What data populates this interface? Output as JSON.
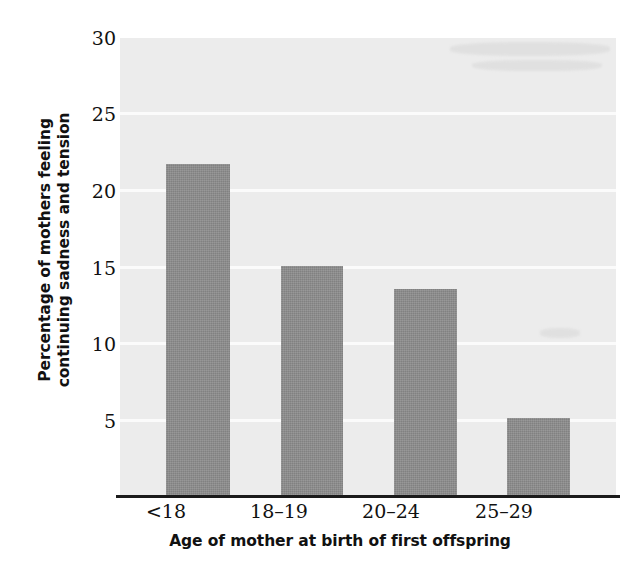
{
  "chart_data": {
    "type": "bar",
    "title": "",
    "categories": [
      "<18",
      "18–19",
      "20–24",
      "25–29"
    ],
    "values": [
      21.8,
      15.1,
      13.6,
      5.2
    ],
    "xlabel": "Age of mother at birth of first offspring",
    "ylabel_lines": [
      "Percentage of mothers feeling",
      "continuing sadness and tension"
    ],
    "ylabel": "Percentage of mothers feeling continuing sadness and tension",
    "ylim": [
      0,
      30
    ],
    "yticks": [
      30,
      25,
      20,
      15,
      10,
      5
    ],
    "ytick_labels": [
      "30",
      "25",
      "20",
      "15",
      "10",
      "5"
    ],
    "grid": "horizontal",
    "legend": "none",
    "bar_color": "#8c8c8c",
    "plot_background": "#ececec",
    "gridline_color": "#fbfbfb",
    "axis_color": "#1b1b1b"
  },
  "axis": {
    "y": {
      "label_line_1": "Percentage of mothers feeling",
      "label_line_2": "continuing sadness and tension",
      "ticks": [
        {
          "label": "30",
          "value": 30
        },
        {
          "label": "25",
          "value": 25
        },
        {
          "label": "20",
          "value": 20
        },
        {
          "label": "15",
          "value": 15
        },
        {
          "label": "10",
          "value": 10
        },
        {
          "label": "5",
          "value": 5
        }
      ]
    },
    "x": {
      "label": "Age of mother at birth of first offspring",
      "ticks": [
        {
          "label": "<18"
        },
        {
          "label": "18–19"
        },
        {
          "label": "20–24"
        },
        {
          "label": "25–29"
        }
      ]
    }
  },
  "bars": [
    {
      "category": "<18",
      "value": 21.8
    },
    {
      "category": "18–19",
      "value": 15.1
    },
    {
      "category": "20–24",
      "value": 13.6
    },
    {
      "category": "25–29",
      "value": 5.2
    }
  ]
}
